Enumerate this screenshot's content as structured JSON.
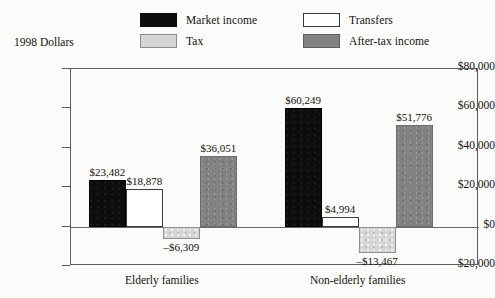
{
  "axis_title": "1998 Dollars",
  "legend": [
    {
      "key": "market",
      "label": "Market income",
      "swatch": "black-swatch"
    },
    {
      "key": "transfers",
      "label": "Transfers",
      "swatch": "white-swatch"
    },
    {
      "key": "tax",
      "label": "Tax",
      "swatch": "light-gray-swatch"
    },
    {
      "key": "aftertax",
      "label": "After-tax income",
      "swatch": "medium-gray-swatch"
    }
  ],
  "y_axis": {
    "ticks": [
      "$80,000",
      "$60,000",
      "$40,000",
      "$20,000",
      "$0",
      "-$20,000"
    ],
    "tick_display": [
      "$80,000",
      "$60,000",
      "$40,000",
      "$20,000",
      "$0",
      "–$20,000"
    ]
  },
  "categories": [
    "Elderly families",
    "Non-elderly families"
  ],
  "bar_labels": {
    "elderly": [
      "$23,482",
      "$18,878",
      "–$6,309",
      "$36,051"
    ],
    "nonelderly": [
      "$60,249",
      "$4,994",
      "–$13,467",
      "$51,776"
    ]
  },
  "colors": {
    "market_income": "#0d0d0d",
    "transfers": "#ffffff",
    "tax": "#d6d6d6",
    "after_tax_income": "#828282",
    "frame": "#5b5b5b",
    "background": "#fbfbf9",
    "text": "#14120f"
  },
  "chart_data": {
    "type": "bar",
    "title": "",
    "subtitle": "",
    "xlabel": "",
    "ylabel": "1998 Dollars",
    "categories": [
      "Elderly families",
      "Non-elderly families"
    ],
    "series": [
      {
        "name": "Market income",
        "values": [
          23482,
          60249
        ],
        "color": "#0d0d0d"
      },
      {
        "name": "Transfers",
        "values": [
          18878,
          4994
        ],
        "color": "#ffffff"
      },
      {
        "name": "Tax",
        "values": [
          -6309,
          -13467
        ],
        "color": "#d6d6d6"
      },
      {
        "name": "After-tax income",
        "values": [
          36051,
          51776
        ],
        "color": "#828282"
      }
    ],
    "ylim": [
      -20000,
      80000
    ],
    "ytick_values": [
      80000,
      60000,
      40000,
      20000,
      0,
      -20000
    ],
    "ytick_labels": [
      "$80,000",
      "$60,000",
      "$40,000",
      "$20,000",
      "$0",
      "–$20,000"
    ],
    "grid": false,
    "legend_position": "top",
    "data_labels": true,
    "zero_line": true
  }
}
